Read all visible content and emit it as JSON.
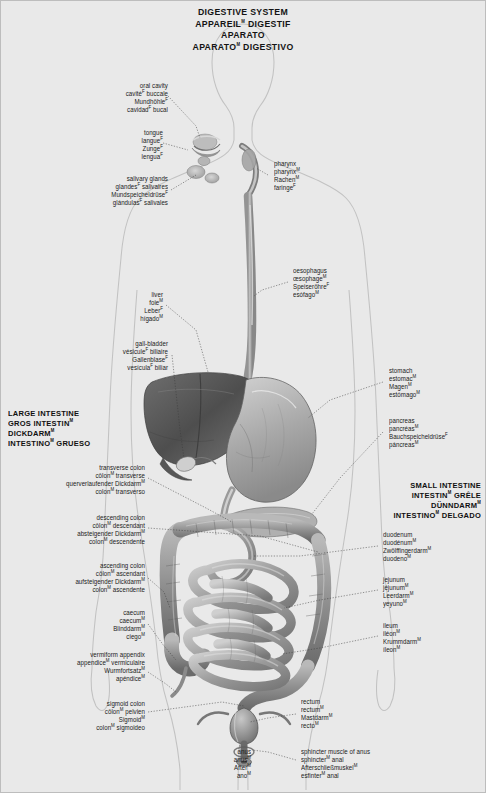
{
  "title": {
    "lines": [
      "DIGESTIVE SYSTEM",
      "APPAREILᴹ DIGESTIF",
      "VERDAUUNGSSYSTEMᴺ",
      "APARATOᴹ DIGESTIVO"
    ],
    "l1": "DIGESTIVE SYSTEM",
    "l2": "APPAREIL",
    "l3": "VERDAUUNGSSYSTEM",
    "l4": "APARATO",
    "l2b": " DIGESTIF",
    "l4b": " DIGESTIVO"
  },
  "headings": {
    "large_intestine": {
      "en": "LARGE INTESTINE",
      "fr": "GROS INTESTIN",
      "de": "DICKDARM",
      "es": "INTESTINO",
      "es_b": " GRUESO",
      "fr_sup": "M",
      "de_sup": "M",
      "es_sup": "M"
    },
    "small_intestine": {
      "en": "SMALL INTESTINE",
      "fr": "INTESTIN",
      "fr_b": " GRÊLE",
      "de": "DÜNNDARM",
      "es": "INTESTINO",
      "es_b": " DELGADO",
      "fr_sup": "M",
      "de_sup": "M",
      "es_sup": "M"
    }
  },
  "labels": {
    "oral_cavity": {
      "en": "oral cavity",
      "fr": "cavité",
      "fr_b": " buccale",
      "de": "Mundhöhle",
      "es": "cavidad",
      "es_b": " bucal",
      "fr_sup": "F",
      "de_sup": "F",
      "es_sup": "F"
    },
    "tongue": {
      "en": "tongue",
      "fr": "langue",
      "de": "Zunge",
      "es": "lengua",
      "fr_sup": "F",
      "de_sup": "F",
      "es_sup": "F"
    },
    "salivary": {
      "en": "salivary glands",
      "fr": "glandes",
      "fr_b": " salivaires",
      "de": "Mundspeicheldrüse",
      "es": "glándulas",
      "es_b": " salivales",
      "fr_sup": "F",
      "de_sup": "F",
      "es_sup": "F"
    },
    "pharynx": {
      "en": "pharynx",
      "fr": "pharynx",
      "de": "Rachen",
      "es": "faringe",
      "fr_sup": "M",
      "de_sup": "M",
      "es_sup": "F"
    },
    "oesophagus": {
      "en": "oesophagus",
      "fr": "œsophage",
      "de": "Speiseröhre",
      "es": "esófago",
      "fr_sup": "M",
      "de_sup": "F",
      "es_sup": "M"
    },
    "liver": {
      "en": "liver",
      "fr": "foie",
      "de": "Leber",
      "es": "hígado",
      "fr_sup": "M",
      "de_sup": "F",
      "es_sup": "M"
    },
    "gall_bladder": {
      "en": "gall-bladder",
      "fr": "vésicule",
      "fr_b": " biliaire",
      "de": "Gallenblase",
      "es": "vesícula",
      "es_b": " biliar",
      "fr_sup": "F",
      "de_sup": "F",
      "es_sup": "F"
    },
    "stomach": {
      "en": "stomach",
      "fr": "estomac",
      "de": "Magen",
      "es": "estómago",
      "fr_sup": "M",
      "de_sup": "M",
      "es_sup": "M"
    },
    "pancreas": {
      "en": "pancreas",
      "fr": "pancréas",
      "de": "Bauchspeicheldrüse",
      "es": "páncreas",
      "fr_sup": "M",
      "de_sup": "F",
      "es_sup": "M"
    },
    "duodenum": {
      "en": "duodenum",
      "fr": "duodénum",
      "de": "Zwölffingerdarm",
      "es": "duodeno",
      "fr_sup": "M",
      "de_sup": "M",
      "es_sup": "M"
    },
    "jejunum": {
      "en": "jejunum",
      "fr": "jéjunum",
      "de": "Leerdarm",
      "es": "yeyuno",
      "fr_sup": "M",
      "de_sup": "M",
      "es_sup": "M"
    },
    "ileum": {
      "en": "ileum",
      "fr": "iléon",
      "de": "Krummdarm",
      "es": "íleon",
      "fr_sup": "M",
      "de_sup": "M",
      "es_sup": "M"
    },
    "transverse": {
      "en": "transverse colon",
      "fr": "côlon",
      "fr_b": " transverse",
      "de": "querverlaufender Dickdarm",
      "es": "colon",
      "es_b": " transverso",
      "fr_sup": "M",
      "de_sup": "M",
      "es_sup": "M"
    },
    "descending": {
      "en": "descending colon",
      "fr": "côlon",
      "fr_b": " descendant",
      "de": "absteigender Dickdarm",
      "es": "colon",
      "es_b": " descendente",
      "fr_sup": "M",
      "de_sup": "M",
      "es_sup": "M"
    },
    "ascending": {
      "en": "ascending colon",
      "fr": "côlon",
      "fr_b": " ascendant",
      "de": "aufsteigender Dickdarm",
      "es": "colon",
      "es_b": " ascendente",
      "fr_sup": "M",
      "de_sup": "M",
      "es_sup": "M"
    },
    "caecum": {
      "en": "caecum",
      "fr": "caecum",
      "de": "Blinddarm",
      "es": "ciego",
      "fr_sup": "M",
      "de_sup": "M",
      "es_sup": "M"
    },
    "appendix": {
      "en": "vermiform appendix",
      "fr": "appendice",
      "fr_b": " vermiculaire",
      "de": "Wurmfortsatz",
      "es": "apéndice",
      "fr_sup": "M",
      "de_sup": "M",
      "es_sup": "M"
    },
    "sigmoid": {
      "en": "sigmoid colon",
      "fr": "côlon",
      "fr_b": " pelvien",
      "de": "Sigmoid",
      "es": "colon",
      "es_b": " sigmoideo",
      "fr_sup": "M",
      "de_sup": "M",
      "es_sup": "M"
    },
    "rectum": {
      "en": "rectum",
      "fr": "rectum",
      "de": "Mastdarm",
      "es": "recto",
      "fr_sup": "M",
      "de_sup": "M",
      "es_sup": "M"
    },
    "anus": {
      "en": "anus",
      "fr": "anus",
      "de": "After",
      "es": "ano",
      "fr_sup": "M",
      "de_sup": "M",
      "es_sup": "M"
    },
    "sphincter": {
      "en": "sphincter muscle of anus",
      "fr": "sphincter",
      "fr_b": " anal",
      "de": "Afterschließmuskel",
      "es": "esfinter",
      "es_b": " anal",
      "fr_sup": "M",
      "de_sup": "M",
      "es_sup": "M"
    }
  },
  "colors": {
    "background": "#e9e9e9",
    "text": "#1a1a1a",
    "leader": "#3a3a3a",
    "outline": "#c2c2c2",
    "organ_dark": "#5a5a5a",
    "organ_mid": "#8c8c8c",
    "organ_light": "#bdbdbd"
  }
}
